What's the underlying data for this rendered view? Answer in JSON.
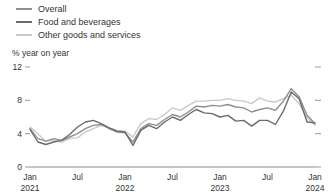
{
  "legend": {
    "items": [
      {
        "label": "Overall",
        "color": "#8e8e8e",
        "icon": "line-swatch-icon"
      },
      {
        "label": "Food and beverages",
        "color": "#6b6b6b",
        "icon": "line-swatch-icon"
      },
      {
        "label": "Other goods and services",
        "color": "#c9c9c9",
        "icon": "line-swatch-icon"
      }
    ]
  },
  "axis": {
    "unit_label": "% year on year",
    "y_ticks": [
      "0",
      "4",
      "8",
      "12"
    ],
    "x_ticks": [
      {
        "month": "Jan",
        "year": "2021"
      },
      {
        "month": "Jul",
        "year": ""
      },
      {
        "month": "Jan",
        "year": "2022"
      },
      {
        "month": "Jul",
        "year": ""
      },
      {
        "month": "Jan",
        "year": "2023"
      },
      {
        "month": "Jul",
        "year": ""
      },
      {
        "month": "Jan",
        "year": "2024"
      }
    ]
  },
  "chart_data": {
    "type": "line",
    "title": "",
    "subtitle": "",
    "xlabel": "",
    "ylabel": "% year on year",
    "ylim": [
      0,
      12
    ],
    "yticks": [
      0,
      4,
      8,
      12
    ],
    "grid": false,
    "legend_position": "top-left",
    "x": [
      "2021-01",
      "2021-02",
      "2021-03",
      "2021-04",
      "2021-05",
      "2021-06",
      "2021-07",
      "2021-08",
      "2021-09",
      "2021-10",
      "2021-11",
      "2021-12",
      "2022-01",
      "2022-02",
      "2022-03",
      "2022-04",
      "2022-05",
      "2022-06",
      "2022-07",
      "2022-08",
      "2022-09",
      "2022-10",
      "2022-11",
      "2022-12",
      "2023-01",
      "2023-02",
      "2023-03",
      "2023-04",
      "2023-05",
      "2023-06",
      "2023-07",
      "2023-08",
      "2023-09",
      "2023-10",
      "2023-11",
      "2023-12",
      "2024-01"
    ],
    "xticklabels": [
      "Jan 2021",
      "Jul",
      "Jan 2022",
      "Jul",
      "Jan 2023",
      "Jul",
      "Jan 2024"
    ],
    "series": [
      {
        "name": "Overall",
        "color": "#8e8e8e",
        "values": [
          4.6,
          3.4,
          3.1,
          3.4,
          3.2,
          3.6,
          4.0,
          4.6,
          5.0,
          5.1,
          4.6,
          4.2,
          4.1,
          3.0,
          4.6,
          5.2,
          5.0,
          5.7,
          6.3,
          6.0,
          6.6,
          7.3,
          7.2,
          7.4,
          7.3,
          7.5,
          7.2,
          7.1,
          6.6,
          6.9,
          7.1,
          6.8,
          7.9,
          9.4,
          8.4,
          6.2,
          5.2
        ]
      },
      {
        "name": "Food and beverages",
        "color": "#6b6b6b",
        "values": [
          4.5,
          3.0,
          2.7,
          3.0,
          3.2,
          3.9,
          4.8,
          5.4,
          5.6,
          5.2,
          4.7,
          4.3,
          4.2,
          2.6,
          4.4,
          5.0,
          4.6,
          5.4,
          6.0,
          5.6,
          6.3,
          6.9,
          6.5,
          6.4,
          6.0,
          6.2,
          5.5,
          5.6,
          4.9,
          5.6,
          5.6,
          5.1,
          6.7,
          9.0,
          8.2,
          5.4,
          5.3
        ]
      },
      {
        "name": "Other goods and services",
        "color": "#c9c9c9",
        "values": [
          4.8,
          4.0,
          3.1,
          3.2,
          3.0,
          3.4,
          3.5,
          4.2,
          4.6,
          5.0,
          4.7,
          4.4,
          4.3,
          3.6,
          5.2,
          5.8,
          5.7,
          6.3,
          7.1,
          6.8,
          7.4,
          7.9,
          7.9,
          8.0,
          8.0,
          8.2,
          8.0,
          7.9,
          7.6,
          8.3,
          7.9,
          7.8,
          8.2,
          8.6,
          7.6,
          5.9,
          5.0
        ]
      }
    ]
  }
}
